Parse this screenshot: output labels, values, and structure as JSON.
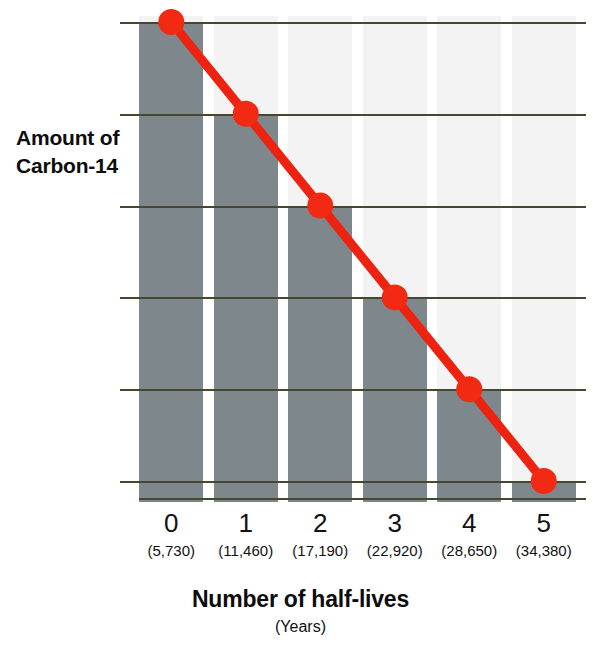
{
  "chart_data": {
    "type": "bar",
    "title": "",
    "xlabel": "Number of half-lives",
    "xlabel_sub": "(Years)",
    "ylabel": "Amount of Carbon-14",
    "categories": [
      "0",
      "1",
      "2",
      "3",
      "4",
      "5"
    ],
    "category_sublabels": [
      "(5,730)",
      "(11,460)",
      "(17,190)",
      "(22,920)",
      "(28,650)",
      "(34,380)"
    ],
    "values": [
      1,
      0.5,
      0.25,
      0.125,
      0.0625,
      0.03125
    ],
    "value_labels": [
      "1",
      "1/2",
      "1/4",
      "1/8",
      "1/16",
      "1/32"
    ],
    "y_tick_labels": [
      "1",
      "1/2",
      "1/4",
      "1/8",
      "1/16",
      "1/32"
    ],
    "y_tick_values": [
      1,
      0.5,
      0.25,
      0.125,
      0.0625,
      0.03125
    ],
    "y_scale": "log2",
    "ylim": [
      0.03125,
      1
    ],
    "grid": true,
    "legend": "none",
    "series": [
      {
        "name": "Carbon-14 remaining",
        "type": "line",
        "marker": "circle",
        "x": [
          0,
          1,
          2,
          3,
          4,
          5
        ],
        "values": [
          1,
          0.5,
          0.25,
          0.125,
          0.0625,
          0.03125
        ]
      },
      {
        "name": "Carbon-14 remaining (bars)",
        "type": "bar",
        "x": [
          0,
          1,
          2,
          3,
          4,
          5
        ],
        "values": [
          1,
          0.5,
          0.25,
          0.125,
          0.0625,
          0.03125
        ]
      }
    ],
    "colors": {
      "bar": "#7d878c",
      "line": "#ee2211",
      "marker": "#f22a14",
      "gridline": "#45472f",
      "band": "#f2f3f2",
      "text": "#111111",
      "background": "#ffffff"
    }
  },
  "axes": {
    "y_title": "Amount of Carbon-14",
    "x_title": "Number of half-lives",
    "x_subtitle": "(Years)"
  },
  "y_ticks": [
    {
      "label": "1",
      "size": "big"
    },
    {
      "label": "1/2",
      "size": "big"
    },
    {
      "label": "1/4",
      "size": "big"
    },
    {
      "label": "1/8",
      "size": "big"
    },
    {
      "label": "1/16",
      "size": "small"
    },
    {
      "label": "1/32",
      "size": "small"
    }
  ],
  "x_ticks": [
    {
      "label": "0",
      "years": "(5,730)"
    },
    {
      "label": "1",
      "years": "(11,460)"
    },
    {
      "label": "2",
      "years": "(17,190)"
    },
    {
      "label": "3",
      "years": "(22,920)"
    },
    {
      "label": "4",
      "years": "(28,650)"
    },
    {
      "label": "5",
      "years": "(34,380)"
    }
  ]
}
